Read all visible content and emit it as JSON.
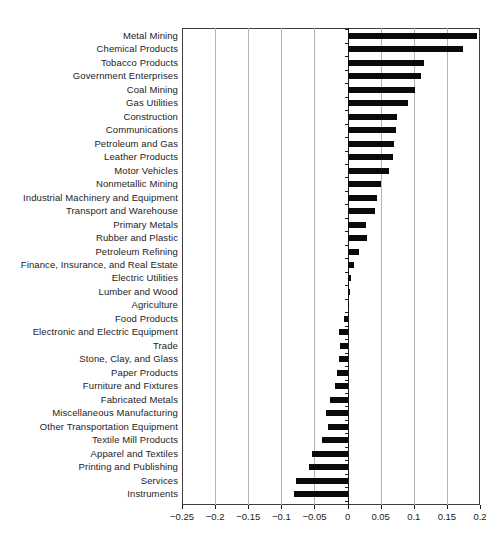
{
  "figure": {
    "background": "#ffffff",
    "frame_color": "#3d3d3d",
    "gridline_color": "#b4b4b4",
    "text_color": "#1c1c1c"
  },
  "chart_data": {
    "type": "bar",
    "orientation": "horizontal",
    "title": "",
    "xlabel": "",
    "ylabel": "",
    "grid": true,
    "legend": false,
    "bar_color": "#0a0a0a",
    "xlim": [
      -0.25,
      0.2
    ],
    "categories": [
      "Metal Mining",
      "Chemical Products",
      "Tobacco Products",
      "Government Enterprises",
      "Coal Mining",
      "Gas Utilities",
      "Construction",
      "Communications",
      "Petroleum and Gas",
      "Leather Products",
      "Motor Vehicles",
      "Nonmetallic Mining",
      "Industrial Machinery and Equipment",
      "Transport and Warehouse",
      "Primary Metals",
      "Rubber and Plastic",
      "Petroleum Refining",
      "Finance, Insurance, and Real Estate",
      "Electric Utilities",
      "Lumber and Wood",
      "Agriculture",
      "Food Products",
      "Electronic and Electric Equipment",
      "Trade",
      "Stone, Clay, and Glass",
      "Paper Products",
      "Furniture and Fixtures",
      "Fabricated Metals",
      "Miscellaneous Manufacturing",
      "Other Transportation Equipment",
      "Textile Mill Products",
      "Apparel and Textiles",
      "Printing and Publishing",
      "Services",
      "Instruments"
    ],
    "values": [
      0.195,
      0.174,
      0.115,
      0.111,
      0.102,
      0.091,
      0.075,
      0.073,
      0.07,
      0.068,
      0.063,
      0.05,
      0.045,
      0.041,
      0.028,
      0.029,
      0.017,
      0.01,
      0.005,
      0.003,
      0.001,
      -0.005,
      -0.013,
      -0.012,
      -0.013,
      -0.016,
      -0.019,
      -0.026,
      -0.032,
      -0.03,
      -0.039,
      -0.054,
      -0.058,
      -0.078,
      -0.081
    ],
    "x_ticks": [
      {
        "value": -0.25,
        "label": "−0.25"
      },
      {
        "value": -0.2,
        "label": "−0.2"
      },
      {
        "value": -0.15,
        "label": "−0.15"
      },
      {
        "value": -0.1,
        "label": "−0.1"
      },
      {
        "value": -0.05,
        "label": "−0.05"
      },
      {
        "value": 0,
        "label": "0"
      },
      {
        "value": 0.05,
        "label": "0.05"
      },
      {
        "value": 0.1,
        "label": "0.1"
      },
      {
        "value": 0.15,
        "label": "0.15"
      },
      {
        "value": 0.2,
        "label": "0.2"
      }
    ]
  }
}
